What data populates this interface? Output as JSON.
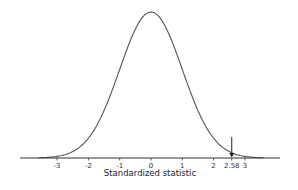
{
  "chart_data": {
    "type": "line",
    "title": "",
    "xlabel": "Standardized statistic",
    "ylabel": "",
    "series": [
      {
        "name": "Standard normal density",
        "distribution": "normal",
        "mean": 0,
        "sd": 1
      }
    ],
    "xlim": [
      -3.5,
      3.5
    ],
    "xticks": [
      -3,
      -2,
      -1,
      0,
      1,
      2,
      2.58,
      3
    ],
    "xtick_labels": [
      "-3",
      "-2",
      "-1",
      "0",
      "1",
      "2",
      "2.58",
      "3"
    ],
    "annotations": [
      {
        "type": "arrow",
        "x": 2.58,
        "direction": "down",
        "label": "2.58"
      }
    ],
    "grid": false,
    "legend": "none",
    "colors": {
      "curve": "#555555",
      "axis": "#333333",
      "arrow": "#222222"
    }
  }
}
